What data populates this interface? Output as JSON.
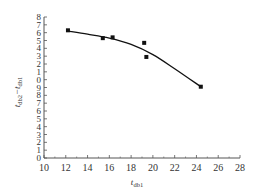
{
  "chart_data": {
    "type": "scatter",
    "title": "",
    "xlabel": "t_db1",
    "ylabel": "t_db2 − t_db1",
    "xlim": [
      10,
      28
    ],
    "ylim": [
      0,
      18
    ],
    "x_ticks": [
      10,
      12,
      14,
      16,
      18,
      20,
      22,
      24,
      26,
      28
    ],
    "y_ticks": [
      0,
      1,
      2,
      3,
      4,
      5,
      6,
      7,
      8,
      9,
      10,
      11,
      12,
      13,
      14,
      15,
      16,
      17,
      18
    ],
    "y_tick_labels_printed": [
      "0",
      "1",
      "2",
      "3",
      "4",
      "5",
      "6",
      "7",
      "8",
      "9",
      "0",
      "1",
      "2",
      "3",
      "4",
      "5",
      "6",
      "7",
      "8"
    ],
    "grid": false,
    "legend": null,
    "series": [
      {
        "name": "measured",
        "kind": "scatter",
        "marker": "square",
        "x": [
          12.2,
          15.4,
          16.3,
          19.2,
          19.4,
          24.4
        ],
        "y": [
          16.3,
          15.3,
          15.4,
          14.7,
          12.9,
          9.1
        ]
      },
      {
        "name": "fitted curve",
        "kind": "line",
        "x": [
          12.2,
          14,
          16,
          18,
          20,
          22,
          24.4
        ],
        "y": [
          16.2,
          15.8,
          15.3,
          14.5,
          13.2,
          11.4,
          9.1
        ]
      }
    ]
  },
  "labels": {
    "x_main": "t",
    "x_sub": "db1",
    "y_main1": "t",
    "y_sub1": "db2",
    "y_sep": "−",
    "y_main2": "t",
    "y_sub2": "db1"
  },
  "colors": {
    "axis": "#555555",
    "data": "#111111"
  }
}
